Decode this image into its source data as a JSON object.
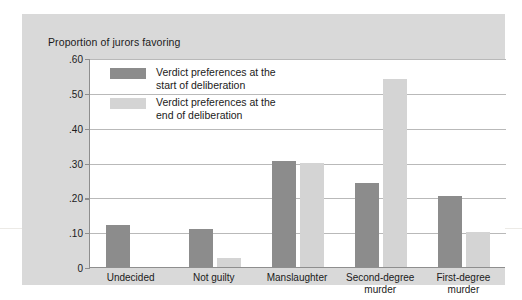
{
  "chart_data": {
    "type": "bar",
    "title": "Proportion of jurors favoring",
    "xlabel": "",
    "ylabel": "Proportion of jurors favoring",
    "ylim": [
      0,
      0.6
    ],
    "ytick_labels": [
      ".60",
      ".50",
      ".40",
      ".30",
      ".20",
      ".10",
      "0"
    ],
    "ytick_values": [
      0.6,
      0.5,
      0.4,
      0.3,
      0.2,
      0.1,
      0
    ],
    "grid": "horizontal",
    "legend_position": "inside-top-left",
    "categories": [
      "Undecided",
      "Not guilty",
      "Manslaughter",
      "Second-degree\nmurder",
      "First-degree\nmurder"
    ],
    "series": [
      {
        "name": "Verdict preferences at the\nstart of deliberation",
        "color": "#8c8c8c",
        "values": [
          0.12,
          0.11,
          0.305,
          0.24,
          0.205
        ]
      },
      {
        "name": "Verdict preferences at the\nend of deliberation",
        "color": "#d4d4d4",
        "values": [
          0.0,
          0.025,
          0.3,
          0.54,
          0.1
        ]
      }
    ]
  },
  "legend": {
    "entries": [
      {
        "label": "Verdict preferences at the\nstart of deliberation",
        "swatch": "dark"
      },
      {
        "label": "Verdict preferences at the\nend of deliberation",
        "swatch": "light"
      }
    ]
  },
  "colors": {
    "panel_background": "#d9d9d9",
    "plot_background": "#ffffff",
    "series_start": "#8c8c8c",
    "series_end": "#d4d4d4",
    "axis": "#8e8e8e",
    "gridline": "#b9b9b9",
    "text": "#1b1b1b"
  }
}
